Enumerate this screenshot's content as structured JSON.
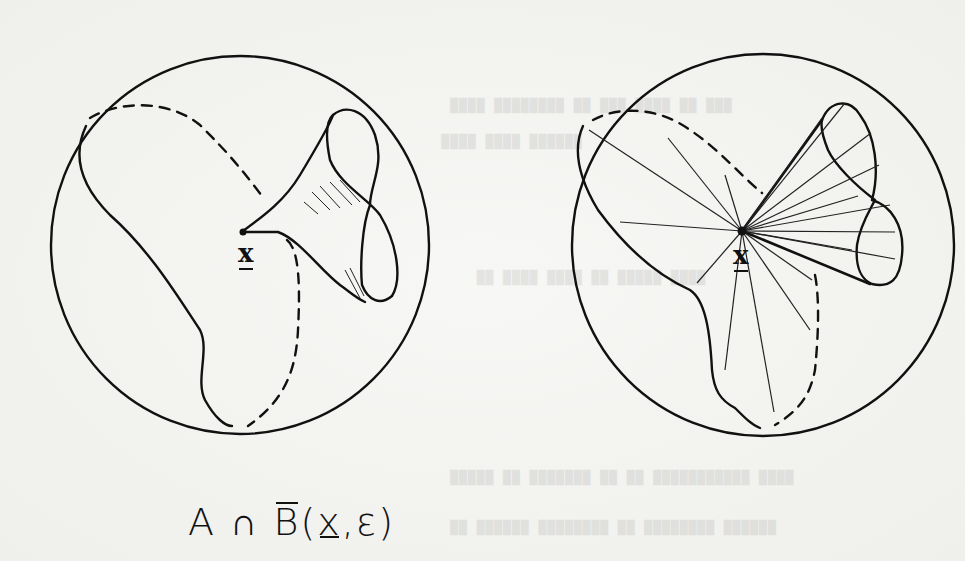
{
  "figure": {
    "left_panel": {
      "name": "set-A-with-point-x",
      "point_label": "x",
      "shading": "hatched funnel near x"
    },
    "right_panel": {
      "name": "star-shaped-rays-from-x",
      "point_label": "x",
      "shading": "rays emanating from x"
    },
    "caption": {
      "set": "A",
      "op": "∩",
      "ball": "B",
      "open_paren": "(",
      "point": "x",
      "comma": ",",
      "radius": "ε",
      "close_paren": ")"
    }
  },
  "background_bleed_text": {
    "note": "faint illegible bleed-through typewriter text from reverse of page"
  }
}
